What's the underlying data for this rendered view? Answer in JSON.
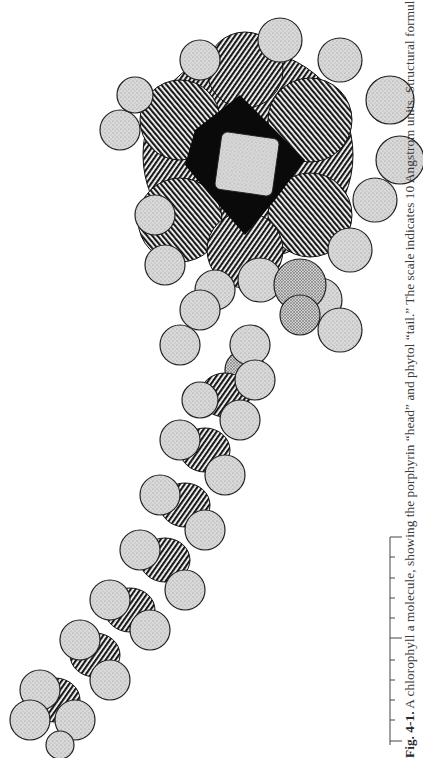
{
  "figure": {
    "label": "Fig. 4-1.",
    "caption_text": " A chlorophyll a molecule, showing the porphyrin “head” and phytol “tail.” The scale indicates 10 Angstrom units. Structural formula is given in",
    "parts": [
      "porphyrin head",
      "phytol tail"
    ]
  },
  "scale_bar": {
    "units": "Angstrom",
    "length": 10,
    "ticks": 10,
    "major_tick_index": 5
  }
}
